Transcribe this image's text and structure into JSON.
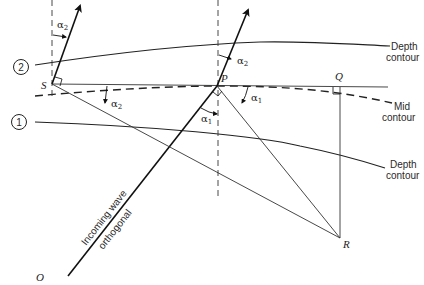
{
  "diagram": {
    "labels": {
      "depth_contour_top": [
        "Depth",
        "contour"
      ],
      "mid_contour": [
        "Mid",
        "contour"
      ],
      "depth_contour_bottom": [
        "Depth",
        "contour"
      ],
      "orthogonal_line1": "Incoming wave",
      "orthogonal_line2": "orthogonal"
    },
    "contour_markers": {
      "top": "2",
      "bottom": "1"
    },
    "points": {
      "S": "S",
      "P": "P",
      "Q": "Q",
      "R": "R",
      "O": "O"
    },
    "angles": {
      "alpha2_at_S_top": "α",
      "alpha2_at_S_top_sub": "2",
      "alpha2_at_S_low": "α",
      "alpha2_at_S_low_sub": "2",
      "alpha2_at_P": "α",
      "alpha2_at_P_sub": "2",
      "alpha1_at_P_right": "α",
      "alpha1_at_P_right_sub": "1",
      "alpha1_at_P_left": "α",
      "alpha1_at_P_left_sub": "1"
    }
  }
}
